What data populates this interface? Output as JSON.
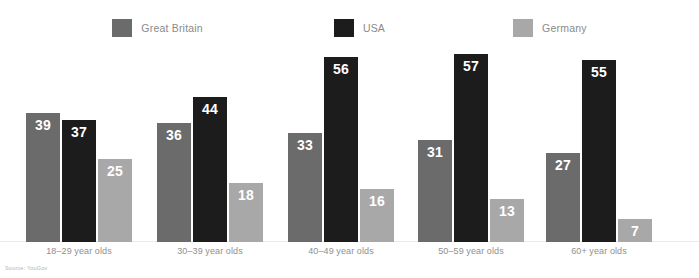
{
  "chart_data": {
    "type": "bar",
    "title": "",
    "subtitle": "",
    "xlabel": "",
    "ylabel": "",
    "ylim": [
      0,
      60
    ],
    "grid": false,
    "legend_position": "top-center",
    "categories": [
      "18–29 year olds",
      "30–39 year olds",
      "40–49 year olds",
      "50–59 year olds",
      "60+ year olds"
    ],
    "series": [
      {
        "name": "Great Britain",
        "color": "#6b6b6b",
        "values": [
          39,
          36,
          33,
          31,
          27
        ]
      },
      {
        "name": "USA",
        "color": "#1c1c1c",
        "values": [
          37,
          44,
          56,
          57,
          55
        ]
      },
      {
        "name": "Germany",
        "color": "#a8a8a8",
        "values": [
          25,
          18,
          16,
          13,
          7
        ]
      }
    ],
    "source": "Source: YouGov"
  },
  "legend": {
    "items": [
      {
        "label": "Great Britain",
        "color": "#6b6b6b"
      },
      {
        "label": "USA",
        "color": "#1c1c1c"
      },
      {
        "label": "Germany",
        "color": "#a8a8a8"
      }
    ]
  },
  "footer": {
    "source": "Source: YouGov"
  },
  "colors": {
    "great_britain": "#6b6b6b",
    "usa": "#1c1c1c",
    "germany": "#a8a8a8",
    "background": "#ffffff",
    "label_text": "#8f8f8f",
    "value_text": "#ffffff",
    "baseline": "#e9e9e9"
  }
}
